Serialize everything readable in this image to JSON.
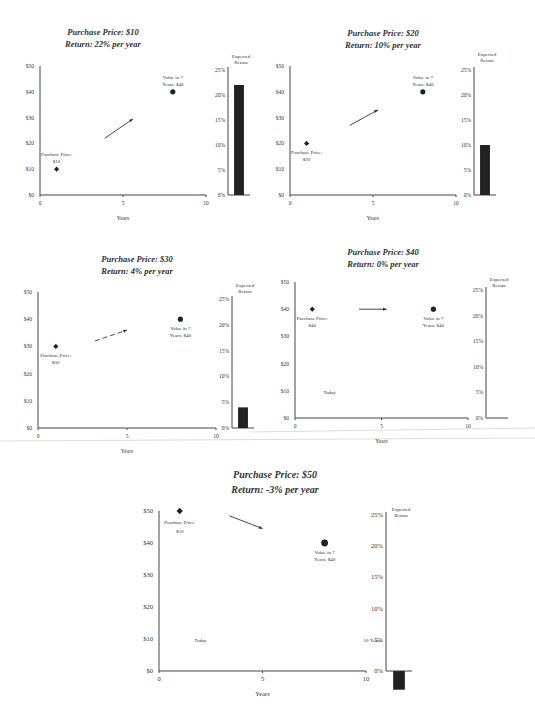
{
  "chart_data": [
    {
      "type": "scatter",
      "title": "Purchase Price: $10",
      "subtitle": "Return: 22% per year",
      "xlabel": "Years",
      "ylabel": "",
      "xlim": [
        0,
        10
      ],
      "ylim": [
        0,
        50
      ],
      "x_ticks": [
        "0",
        "5",
        "10"
      ],
      "y_ticks": [
        "$0",
        "$10",
        "$20",
        "$30",
        "$40",
        "$50"
      ],
      "points": [
        {
          "name": "Purchase Price",
          "x": 1,
          "y": 10,
          "marker": "diamond",
          "label": [
            "Purchase Price:",
            "$10"
          ],
          "label_pos": "above"
        },
        {
          "name": "Value in 7 Years",
          "x": 8,
          "y": 40,
          "marker": "circle",
          "label": [
            "Value in 7",
            "Years: $40"
          ],
          "label_pos": "above"
        }
      ],
      "arrow": {
        "from": [
          3.9,
          22
        ],
        "to": [
          5.6,
          29.5
        ],
        "style": "solid"
      },
      "annotations": [],
      "bar": {
        "title": [
          "Expected",
          "Return"
        ],
        "value": 22,
        "ylim": [
          0,
          25
        ],
        "y_ticks": [
          "0%",
          "5%",
          "10%",
          "15%",
          "20%",
          "25%"
        ]
      }
    },
    {
      "type": "scatter",
      "title": "Purchase Price: $20",
      "subtitle": "Return: 10% per year",
      "xlabel": "Years",
      "ylabel": "",
      "xlim": [
        0,
        10
      ],
      "ylim": [
        0,
        50
      ],
      "x_ticks": [
        "0",
        "5",
        "10"
      ],
      "y_ticks": [
        "$0",
        "$10",
        "$20",
        "$30",
        "$40",
        "$50"
      ],
      "points": [
        {
          "name": "Purchase Price",
          "x": 1,
          "y": 20,
          "marker": "diamond",
          "label": [
            "Purchase Price:",
            "$20"
          ],
          "label_pos": "below"
        },
        {
          "name": "Value in 7 Years",
          "x": 8,
          "y": 40,
          "marker": "circle",
          "label": [
            "Value in 7",
            "Years: $40"
          ],
          "label_pos": "above"
        }
      ],
      "arrow": {
        "from": [
          3.6,
          27
        ],
        "to": [
          5.3,
          33
        ],
        "style": "solid"
      },
      "annotations": [],
      "bar": {
        "title": [
          "Expected",
          "Return"
        ],
        "value": 10,
        "ylim": [
          0,
          25
        ],
        "y_ticks": [
          "0%",
          "5%",
          "10%",
          "15%",
          "20%",
          "25%"
        ]
      }
    },
    {
      "type": "scatter",
      "title": "Purchase Price: $30",
      "subtitle": "Return: 4% per year",
      "xlabel": "Years",
      "ylabel": "",
      "xlim": [
        0,
        10
      ],
      "ylim": [
        0,
        50
      ],
      "x_ticks": [
        "0",
        "5",
        "10"
      ],
      "y_ticks": [
        "$0",
        "$10",
        "$20",
        "$30",
        "$40",
        "$50"
      ],
      "points": [
        {
          "name": "Purchase Price",
          "x": 1,
          "y": 30,
          "marker": "diamond",
          "label": [
            "Purchase Price:",
            "$30"
          ],
          "label_pos": "below"
        },
        {
          "name": "Value in 7 Years",
          "x": 8,
          "y": 40,
          "marker": "circle",
          "label": [
            "Value in 7",
            "Years: $40"
          ],
          "label_pos": "below"
        }
      ],
      "arrow": {
        "from": [
          3.2,
          32
        ],
        "to": [
          5.0,
          36
        ],
        "style": "dashed"
      },
      "annotations": [],
      "bar": {
        "title": [
          "Expected",
          "Return"
        ],
        "value": 4,
        "ylim": [
          0,
          25
        ],
        "y_ticks": [
          "0%",
          "5%",
          "10%",
          "15%",
          "20%",
          "25%"
        ]
      }
    },
    {
      "type": "scatter",
      "title": "Purchase Price: $40",
      "subtitle": "Return: 0% per year",
      "xlabel": "Years",
      "ylabel": "",
      "xlim": [
        0,
        10
      ],
      "ylim": [
        0,
        50
      ],
      "x_ticks": [
        "0",
        "5",
        "10"
      ],
      "y_ticks": [
        "$0",
        "$10",
        "$20",
        "$30",
        "$40",
        "$50"
      ],
      "points": [
        {
          "name": "Purchase Price",
          "x": 1,
          "y": 40,
          "marker": "diamond",
          "label": [
            "Purchase Price:",
            "$40"
          ],
          "label_pos": "below"
        },
        {
          "name": "Value in 7 Years",
          "x": 8,
          "y": 40,
          "marker": "circle",
          "label": [
            "Value in 7",
            "Years: $40"
          ],
          "label_pos": "below"
        }
      ],
      "arrow": {
        "from": [
          3.7,
          40
        ],
        "to": [
          5.3,
          40
        ],
        "style": "solid"
      },
      "annotations": [
        {
          "text": "Today",
          "x": 2,
          "y": 9
        }
      ],
      "bar": {
        "title": [
          "Expected",
          "Return"
        ],
        "value": 0,
        "ylim": [
          0,
          25
        ],
        "y_ticks": [
          "0%",
          "5%",
          "10%",
          "15%",
          "20%",
          "25%"
        ]
      }
    },
    {
      "type": "scatter",
      "title": "Purchase Price: $50",
      "subtitle": "Return: -3% per year",
      "xlabel": "Years",
      "ylabel": "",
      "xlim": [
        0,
        10
      ],
      "ylim": [
        0,
        50
      ],
      "x_ticks": [
        "0",
        "5",
        "10"
      ],
      "y_ticks": [
        "$0",
        "$10",
        "$20",
        "$30",
        "$40",
        "$50"
      ],
      "points": [
        {
          "name": "Purchase Price",
          "x": 1,
          "y": 50,
          "marker": "diamond",
          "label": [
            "Purchase Price:",
            "$50"
          ],
          "label_pos": "below"
        },
        {
          "name": "Value in 7 Years",
          "x": 8,
          "y": 40,
          "marker": "circle",
          "label": [
            "Value in 7",
            "Years: $40"
          ],
          "label_pos": "below"
        }
      ],
      "arrow": {
        "from": [
          3.4,
          48.5
        ],
        "to": [
          5.0,
          44.5
        ],
        "style": "solid"
      },
      "annotations": [
        {
          "text": "Today",
          "x": 2,
          "y": 9
        },
        {
          "text": "10 Years",
          "x": 10.3,
          "y": 9
        }
      ],
      "bar": {
        "title": [
          "Expected",
          "Return"
        ],
        "value": -3,
        "ylim": [
          0,
          25
        ],
        "y_ticks": [
          "0%",
          "5%",
          "10%",
          "15%",
          "20%",
          "25%"
        ]
      }
    }
  ]
}
